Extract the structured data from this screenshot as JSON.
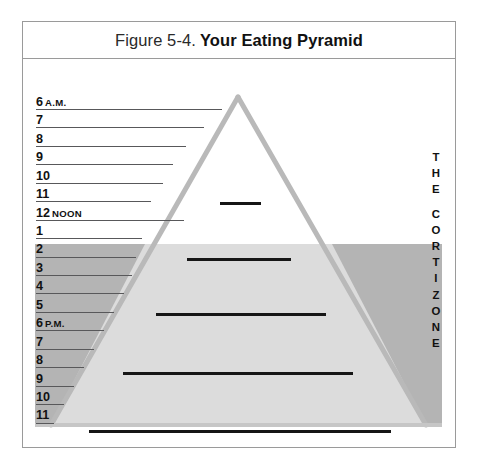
{
  "figure": {
    "caption_number": "Figure 5-4.",
    "caption_title": "Your Eating Pyramid",
    "frame_border_color": "#9a9a9a",
    "background_color": "#ffffff"
  },
  "colors": {
    "pyramid_outline": "#b9b9b9",
    "pyramid_fill_upper": "#ffffff",
    "pyramid_fill_lower": "#dcdcdc",
    "cortizone_band": "#b4b4b4",
    "rule_line": "#58585a",
    "meal_bar": "#161616",
    "text": "#111111"
  },
  "chart_data": {
    "type": "area",
    "title": "Your Eating Pyramid",
    "xlabel": "",
    "ylabel": "Time of day",
    "grid": true,
    "legend_position": "none",
    "categories": [
      "6 A.M.",
      "7",
      "8",
      "9",
      "10",
      "11",
      "12 NOON",
      "1",
      "2",
      "3",
      "4",
      "5",
      "6 P.M.",
      "7",
      "8",
      "9",
      "10",
      "11"
    ],
    "annotations": [
      {
        "label": "THE CORTIZONE",
        "region": "shaded band from 3 P.M. to 11 P.M."
      }
    ],
    "series": [
      {
        "name": "Meal size (bar length)",
        "note": "Horizontal black bars indicate relative meal size at each hour",
        "values": [
          {
            "hour": "6 A.M.",
            "bar_length": 0
          },
          {
            "hour": "7",
            "bar_length": 0
          },
          {
            "hour": "8",
            "bar_length": 0
          },
          {
            "hour": "9",
            "bar_length": 40
          },
          {
            "hour": "10",
            "bar_length": 0
          },
          {
            "hour": "11",
            "bar_length": 0
          },
          {
            "hour": "12 NOON",
            "bar_length": 104
          },
          {
            "hour": "1",
            "bar_length": 0
          },
          {
            "hour": "2",
            "bar_length": 0
          },
          {
            "hour": "3",
            "bar_length": 170
          },
          {
            "hour": "4",
            "bar_length": 0
          },
          {
            "hour": "5",
            "bar_length": 0
          },
          {
            "hour": "6 P.M.",
            "bar_length": 230
          },
          {
            "hour": "7",
            "bar_length": 0
          },
          {
            "hour": "8",
            "bar_length": 0
          },
          {
            "hour": "9",
            "bar_length": 302
          },
          {
            "hour": "10",
            "bar_length": 0
          },
          {
            "hour": "11",
            "bar_length": 0
          }
        ]
      }
    ]
  },
  "hours": [
    {
      "label": "6",
      "suffix": "A.M.",
      "rule_width": 186,
      "shaded": false
    },
    {
      "label": "7",
      "suffix": "",
      "rule_width": 168,
      "shaded": false
    },
    {
      "label": "8",
      "suffix": "",
      "rule_width": 150,
      "shaded": false
    },
    {
      "label": "9",
      "suffix": "",
      "rule_width": 137,
      "shaded": false
    },
    {
      "label": "10",
      "suffix": "",
      "rule_width": 127,
      "shaded": false
    },
    {
      "label": "11",
      "suffix": "",
      "rule_width": 115,
      "shaded": false
    },
    {
      "label": "12",
      "suffix": "NOON",
      "rule_width": 148,
      "shaded": false
    },
    {
      "label": "1",
      "suffix": "",
      "rule_width": 106,
      "shaded": false
    },
    {
      "label": "2",
      "suffix": "",
      "rule_width": 100,
      "shaded": false
    },
    {
      "label": "3",
      "suffix": "",
      "rule_width": 96,
      "shaded": false
    },
    {
      "label": "4",
      "suffix": "",
      "rule_width": 88,
      "shaded": true
    },
    {
      "label": "5",
      "suffix": "",
      "rule_width": 78,
      "shaded": true
    },
    {
      "label": "6",
      "suffix": "P.M.",
      "rule_width": 68,
      "shaded": true
    },
    {
      "label": "7",
      "suffix": "",
      "rule_width": 58,
      "shaded": true
    },
    {
      "label": "8",
      "suffix": "",
      "rule_width": 48,
      "shaded": true
    },
    {
      "label": "9",
      "suffix": "",
      "rule_width": 38,
      "shaded": true
    },
    {
      "label": "10",
      "suffix": "",
      "rule_width": 28,
      "shaded": true
    },
    {
      "label": "11",
      "suffix": "",
      "rule_width": 18,
      "shaded": true
    }
  ],
  "meal_bars": [
    {
      "name": "breakfast-bar",
      "hour": "9",
      "x": 197,
      "y": 143,
      "width": 41
    },
    {
      "name": "lunch-bar",
      "hour": "12 NOON",
      "x": 164,
      "y": 199,
      "width": 104
    },
    {
      "name": "afternoon-bar",
      "hour": "3",
      "x": 133,
      "y": 254,
      "width": 170
    },
    {
      "name": "dinner-bar",
      "hour": "6 P.M.",
      "x": 100,
      "y": 313,
      "width": 230
    },
    {
      "name": "late-night-bar",
      "hour": "9 P.M.",
      "x": 66,
      "y": 371,
      "width": 302
    }
  ],
  "cortizone": {
    "letters": [
      "T",
      "H",
      "E",
      "",
      "C",
      "O",
      "R",
      "T",
      "I",
      "Z",
      "O",
      "N",
      "E"
    ],
    "full_text": "THE CORTIZONE"
  }
}
